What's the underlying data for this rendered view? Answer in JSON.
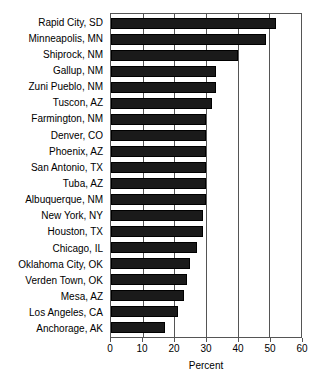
{
  "chart_data": {
    "type": "bar",
    "orientation": "horizontal",
    "title": "",
    "xlabel": "Percent",
    "ylabel": "",
    "xlim": [
      0,
      60
    ],
    "xticks": [
      0,
      10,
      20,
      30,
      40,
      50,
      60
    ],
    "grid": true,
    "legend": null,
    "bar_color": "#1a1a1a",
    "categories": [
      "Rapid City, SD",
      "Minneapolis, MN",
      "Shiprock, NM",
      "Gallup, NM",
      "Zuni Pueblo, NM",
      "Tuscon, AZ",
      "Farmington, NM",
      "Denver, CO",
      "Phoenix, AZ",
      "San Antonio, TX",
      "Tuba, AZ",
      "Albuquerque, NM",
      "New York, NY",
      "Houston, TX",
      "Chicago, IL",
      "Oklahoma City, OK",
      "Verden Town, OK",
      "Mesa, AZ",
      "Los Angeles, CA",
      "Anchorage, AK"
    ],
    "values": [
      52,
      49,
      40,
      33,
      33,
      32,
      30,
      30,
      30,
      30,
      30,
      30,
      29,
      29,
      27,
      25,
      24,
      23,
      21,
      17
    ]
  },
  "axis": {
    "x_title": "Percent"
  }
}
